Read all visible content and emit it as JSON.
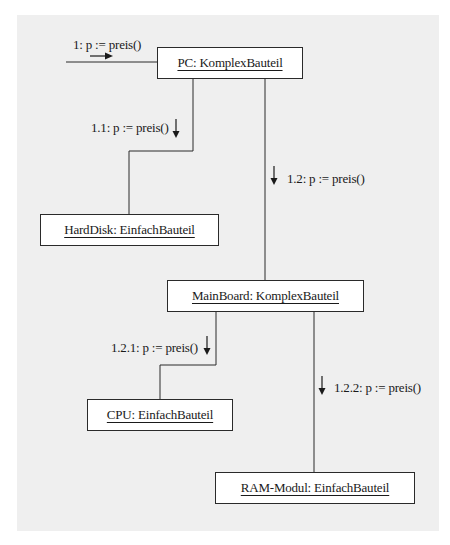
{
  "diagram": {
    "type": "UML collaboration diagram",
    "background_color": "#efefef",
    "objects": [
      {
        "id": "pc",
        "label": "PC: KomplexBauteil"
      },
      {
        "id": "harddisk",
        "label": "HardDisk: EinfachBauteil"
      },
      {
        "id": "mainboard",
        "label": "MainBoard: KomplexBauteil"
      },
      {
        "id": "cpu",
        "label": "CPU: EinfachBauteil"
      },
      {
        "id": "ram",
        "label": "RAM-Modul: EinfachBauteil"
      }
    ],
    "messages": [
      {
        "id": "m1",
        "label": "1:  p := preis()",
        "from": "external",
        "to": "pc",
        "direction": "right"
      },
      {
        "id": "m11",
        "label": "1.1: p := preis()",
        "from": "pc",
        "to": "harddisk",
        "direction": "down"
      },
      {
        "id": "m12",
        "label": "1.2: p := preis()",
        "from": "pc",
        "to": "mainboard",
        "direction": "down"
      },
      {
        "id": "m121",
        "label": "1.2.1: p := preis()",
        "from": "mainboard",
        "to": "cpu",
        "direction": "down"
      },
      {
        "id": "m122",
        "label": "1.2.2: p := preis()",
        "from": "mainboard",
        "to": "ram",
        "direction": "down"
      }
    ]
  }
}
